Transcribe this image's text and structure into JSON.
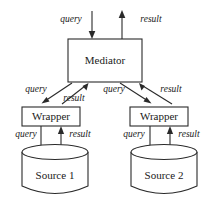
{
  "diagram": {
    "colors": {
      "stroke": "#2a2a2a",
      "fill": "#ffffff",
      "text": "#1a1a1a"
    },
    "nodes": {
      "mediator": {
        "label": "Mediator"
      },
      "wrapper_left": {
        "label": "Wrapper"
      },
      "wrapper_right": {
        "label": "Wrapper"
      },
      "source_left": {
        "label": "Source 1"
      },
      "source_right": {
        "label": "Source 2"
      }
    },
    "edge_labels": {
      "top_query": "query",
      "top_result": "result",
      "mediator_to_wrapper_left_query": "query",
      "wrapper_left_to_mediator_result": "result",
      "mediator_to_wrapper_right_query": "query",
      "wrapper_right_to_mediator_result": "result",
      "wrapper_left_to_source_query": "query",
      "source_left_to_wrapper_result": "result",
      "wrapper_right_to_source_query": "query",
      "source_right_to_wrapper_result": "result"
    }
  }
}
